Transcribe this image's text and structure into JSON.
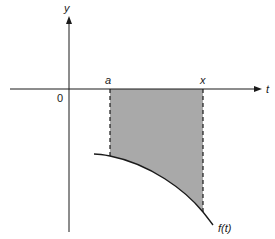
{
  "diagram": {
    "type": "integral-area",
    "axes": {
      "x_label": "t",
      "y_label": "y",
      "origin_label": "0"
    },
    "markers": {
      "lower_bound": "a",
      "upper_bound": "x"
    },
    "curve_label": "f(t)",
    "colors": {
      "shade": "#a9a9a9",
      "line": "#1a1a1a",
      "background": "#ffffff"
    }
  }
}
